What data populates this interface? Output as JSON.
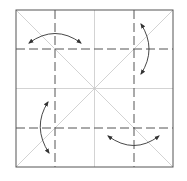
{
  "diagram": {
    "type": "origami-crease-pattern",
    "colors": {
      "border": "#555555",
      "crease": "#c8c8c8",
      "dashed": "#555555",
      "arrow": "#333333",
      "background": "#ffffff"
    },
    "square": {
      "x": 16,
      "y": 10,
      "size": 157
    },
    "dashed_lines": {
      "vertical_x": [
        55,
        134
      ],
      "horizontal_y": [
        49,
        128
      ]
    },
    "arrows": [
      {
        "id": "top-left",
        "orientation": "horizontal"
      },
      {
        "id": "top-right",
        "orientation": "vertical"
      },
      {
        "id": "bottom-left",
        "orientation": "vertical"
      },
      {
        "id": "bottom-right",
        "orientation": "horizontal"
      }
    ]
  }
}
